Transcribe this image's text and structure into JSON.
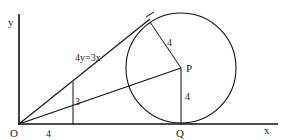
{
  "diagram": {
    "type": "geometry",
    "colors": {
      "stroke": "#111111",
      "background": "#ffffff"
    },
    "labels": {
      "y_axis": "y",
      "x_axis": "x",
      "origin": "O",
      "line_equation": "4y=3x",
      "center": "P",
      "tangent_point_x": "Q",
      "radius_to_tangent": "4",
      "radius_PQ": "4",
      "vertical_segment": "3",
      "horizontal_segment": "4"
    }
  }
}
